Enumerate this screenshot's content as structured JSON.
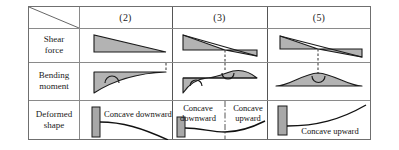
{
  "figure": {
    "type": "engineering-table",
    "corner_cell": {
      "slash": "diagonal-divider",
      "label": ""
    },
    "colors": {
      "diagram_fill": "#b3b3b3",
      "diagram_stroke": "#1a1a1a",
      "support_fill": "#a8a8a8",
      "grid_line": "#8a8a8a",
      "frame": "#6f6f6f",
      "dashed_line": "#333333",
      "background": "#ffffff"
    },
    "columns": [
      {
        "id": "col-2",
        "header": "(2)"
      },
      {
        "id": "col-3",
        "header": "(3)"
      },
      {
        "id": "col-5",
        "header": "(5)"
      }
    ],
    "rows": [
      {
        "id": "row-shear",
        "label_line1": "Shear",
        "label_line2": "force"
      },
      {
        "id": "row-moment",
        "label_line1": "Bending",
        "label_line2": "moment"
      },
      {
        "id": "row-deform",
        "label_line1": "Deformed",
        "label_line2": "shape"
      }
    ],
    "cells": {
      "shear": [
        {
          "column": "(2)",
          "description": "Linearly decreasing positive shear, triangle tall at left tapering to zero at right",
          "sign": "all positive",
          "zero_crossing": false
        },
        {
          "column": "(3)",
          "description": "Shear decreases linearly through zero; positive wedge on left, negative wedge on right",
          "sign": "positive then negative",
          "zero_crossing": true
        },
        {
          "column": "(5)",
          "description": "Shear decreases linearly through zero at mid-span; positive wedge left, negative wedge right",
          "sign": "positive then negative",
          "zero_crossing": true
        }
      ],
      "moment": [
        {
          "column": "(2)",
          "description": "Negative moment, maximum magnitude at fixed left end decaying to zero at right",
          "curvature_symbol": "concave-downward-arc",
          "zero_crossing": false
        },
        {
          "column": "(3)",
          "description": "Moment negative near left support, crosses zero (inflection) and becomes positive toward right",
          "curvature_symbol": "concave-downward-arc then concave-upward-arc",
          "zero_crossing": true
        },
        {
          "column": "(5)",
          "description": "Positive parabolic moment arch, maximum at mid-span where shear is zero",
          "curvature_symbol": "concave-upward-arc",
          "zero_crossing": false
        }
      ],
      "deformed": [
        {
          "column": "(2)",
          "captions": [
            "Concave downward"
          ],
          "description": "Cantilever fixed at left, beam deflects downward with downward concavity"
        },
        {
          "column": "(3)",
          "captions": [
            "Concave downward",
            "Concave upward"
          ],
          "description": "Fixed at left; curvature reverses at the inflection point marked by the dash-dot line"
        },
        {
          "column": "(5)",
          "captions": [
            "Concave upward"
          ],
          "description": "Fixed at left, beam curves upward with upward concavity throughout"
        }
      ]
    }
  }
}
